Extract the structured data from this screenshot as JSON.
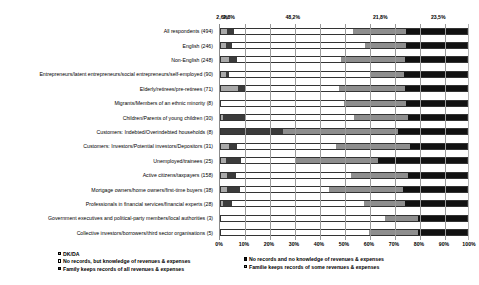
{
  "chart_data": {
    "type": "bar",
    "subtype": "horizontal-stacked-100-percent",
    "title": "",
    "xlabel": "",
    "ylabel": "",
    "xlim": [
      0,
      100
    ],
    "xticks": [
      "0%",
      "10%",
      "20%",
      "30%",
      "40%",
      "50%",
      "60%",
      "70%",
      "80%",
      "90%",
      "100%"
    ],
    "grid": true,
    "legend_position": "bottom",
    "value_labels_top_row": [
      "2,6%",
      "2,8%",
      "48,2%",
      "21,8%",
      "23,5%"
    ],
    "categories": [
      "All respondents (494)",
      "English (246)",
      "Non-English (248)",
      "Entrepreneurs/latent entrepreneurs/social entrepreneurs/self-employed (90)",
      "Elderly/retirees/pre-retirees (71)",
      "Migrants/Members of an ethnic minority (8)",
      "Children/Parents of young children (30)",
      "Customers: Indebted/Overindebted households (8)",
      "Customers: Investors/Potential investors/Depositors (31)",
      "Unemployed/trainees (25)",
      "Active citizens/taxpayers (158)",
      "Mortgage owners/home owners/first-time buyers (38)",
      "Professionals in financial services/financial experts (28)",
      "Government executives and political-party members/local authorities (3)",
      "Collective investors/borrowers/third sector organisations (5)"
    ],
    "series": [
      {
        "name": "DK/DA",
        "color": "#a9a9a9",
        "values": [
          2.6,
          2.0,
          3.2,
          2.2,
          7.0,
          0.0,
          1.0,
          0.0,
          3.2,
          2.0,
          2.5,
          2.6,
          1.0,
          0.0,
          0.0
        ]
      },
      {
        "name": "No records and no knowledge of revenues & expenses",
        "color": "#3b3b3b",
        "values": [
          2.8,
          2.4,
          3.2,
          1.1,
          2.8,
          0.0,
          9.0,
          25.0,
          3.2,
          6.0,
          3.8,
          5.3,
          3.6,
          0.0,
          0.0
        ]
      },
      {
        "name": "No records, but knowledge of revenues & expenses",
        "color": "#ffffff",
        "values": [
          48.2,
          54.0,
          42.4,
          57.8,
          38.0,
          50.0,
          44.0,
          0.0,
          40.3,
          22.0,
          46.7,
          36.1,
          53.4,
          66.7,
          60.0
        ]
      },
      {
        "name": "Familie keeps records of some revenues & expenses",
        "color": "#8e8e8e",
        "values": [
          21.8,
          17.0,
          26.2,
          13.3,
          27.2,
          25.0,
          22.0,
          47.0,
          30.3,
          34.0,
          23.0,
          30.0,
          17.0,
          13.3,
          20.0
        ]
      },
      {
        "name": "Family keeps records of all revenues & expenses",
        "color": "#111111",
        "values": [
          24.6,
          24.6,
          25.0,
          25.6,
          25.0,
          25.0,
          24.0,
          28.0,
          23.0,
          36.0,
          24.0,
          26.0,
          25.0,
          20.0,
          20.0
        ]
      }
    ],
    "legend_left": [
      "DK/DA",
      "No records, but knowledge of revenues & expenses",
      "Family keeps records of all revenues & expenses"
    ],
    "legend_right": [
      "No records and no knowledge of revenues & expenses",
      "Familie keeps records of some revenues & expenses"
    ]
  }
}
